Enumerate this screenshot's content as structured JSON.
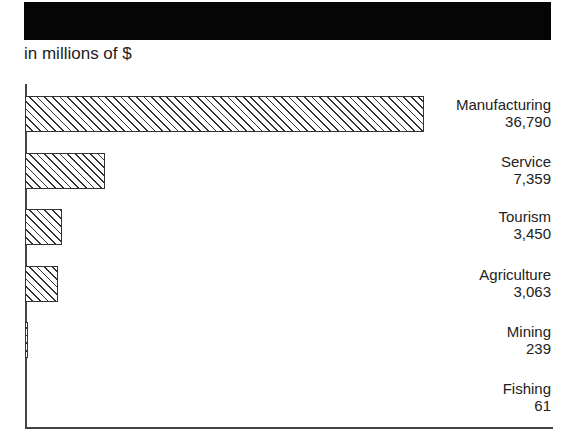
{
  "chart_data": {
    "type": "bar",
    "orientation": "horizontal",
    "title": "",
    "subtitle": "in millions of $",
    "categories": [
      "Manufacturing",
      "Service",
      "Tourism",
      "Agriculture",
      "Mining",
      "Fishing"
    ],
    "values": [
      36790,
      7359,
      3450,
      3063,
      239,
      61
    ],
    "value_labels": [
      "36,790",
      "7,359",
      "3,450",
      "3,063",
      "239",
      "61"
    ],
    "xlabel": "",
    "ylabel": "",
    "xlim": [
      0,
      36790
    ],
    "grid": false,
    "legend": null,
    "bar_pattern": "diagonal-hatch"
  },
  "header": {
    "title_redacted": true,
    "subtitle": "in millions of $"
  },
  "bars": [
    {
      "label": "Manufacturing",
      "value": "36,790"
    },
    {
      "label": "Service",
      "value": "7,359"
    },
    {
      "label": "Tourism",
      "value": "3,450"
    },
    {
      "label": "Agriculture",
      "value": "3,063"
    },
    {
      "label": "Mining",
      "value": "239"
    },
    {
      "label": "Fishing",
      "value": "61"
    }
  ]
}
